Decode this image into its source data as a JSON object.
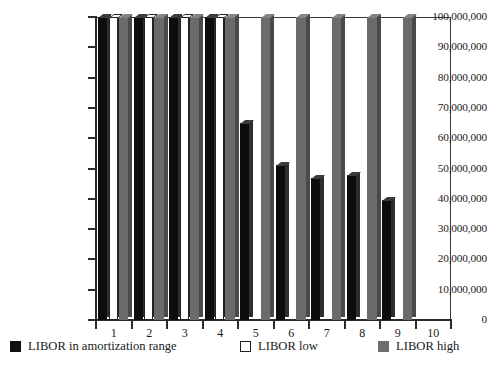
{
  "chart_data": {
    "type": "bar",
    "title": "",
    "subtitle": "",
    "xlabel": "",
    "ylabel": "",
    "grid": false,
    "legend_position": "bottom",
    "categories": [
      "1",
      "2",
      "3",
      "4",
      "5",
      "6",
      "7",
      "8",
      "9",
      "10"
    ],
    "ylim": [
      0,
      100000000
    ],
    "ytick_values": [
      0,
      10000000,
      20000000,
      30000000,
      40000000,
      50000000,
      60000000,
      70000000,
      80000000,
      90000000,
      100000000
    ],
    "ytick_labels": [
      "0",
      "10,000,000",
      "20,000,000",
      "30,000,000",
      "40,000,000",
      "50,000,000",
      "60,000,000",
      "70,000,000",
      "80,000,000",
      "90,000,000",
      "100,000,000"
    ],
    "series": [
      {
        "name": "LIBOR in amortization range",
        "color": "#0d0d0d",
        "swatch": "black",
        "values": [
          100000000,
          100000000,
          100000000,
          100000000,
          65000000,
          51000000,
          47000000,
          48000000,
          39500000,
          0
        ]
      },
      {
        "name": "LIBOR low",
        "color": "#ffffff",
        "swatch": "white",
        "values": [
          100000000,
          100000000,
          100000000,
          100000000,
          0,
          0,
          0,
          0,
          0,
          0
        ]
      },
      {
        "name": "LIBOR high",
        "color": "#6b6b6b",
        "swatch": "gray",
        "values": [
          100000000,
          100000000,
          100000000,
          100000000,
          100000000,
          100000000,
          100000000,
          100000000,
          100000000,
          0
        ]
      }
    ]
  },
  "legend": {
    "items": [
      {
        "label": "LIBOR in amortization range",
        "swatch": "black"
      },
      {
        "label": "LIBOR low",
        "swatch": "white"
      },
      {
        "label": "LIBOR high",
        "swatch": "gray"
      }
    ]
  }
}
